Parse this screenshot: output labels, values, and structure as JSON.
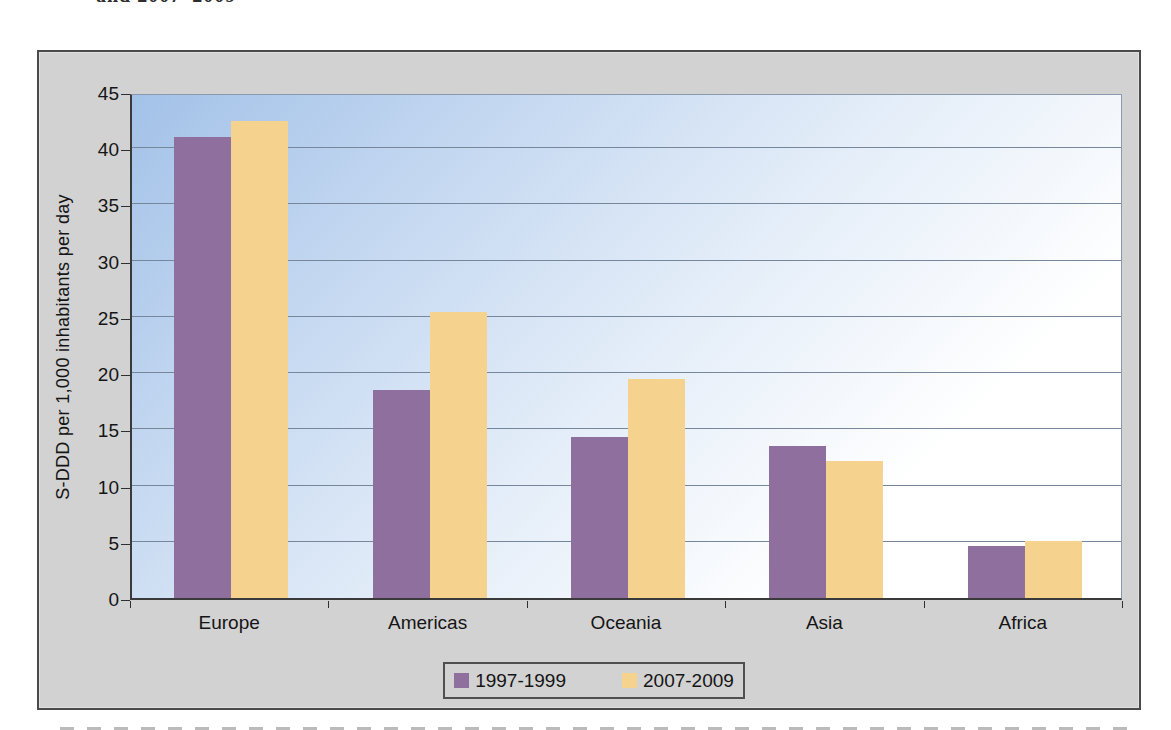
{
  "page": {
    "top_fragment": "and 2007–2009"
  },
  "chart_data": {
    "type": "bar",
    "title": "",
    "categories": [
      "Europe",
      "Americas",
      "Oceania",
      "Asia",
      "Africa"
    ],
    "series": [
      {
        "name": "1997-1999",
        "color": "#8f6f9e",
        "values": [
          41.0,
          18.5,
          14.3,
          13.5,
          4.6
        ]
      },
      {
        "name": "2007-2009",
        "color": "#f6d28f",
        "values": [
          42.4,
          25.4,
          19.5,
          12.2,
          5.1
        ]
      }
    ],
    "xlabel": "",
    "ylabel": "S-DDD per 1,000 inhabitants per day",
    "ylim": [
      0,
      45
    ],
    "yticks": [
      0,
      5,
      10,
      15,
      20,
      25,
      30,
      35,
      40,
      45
    ],
    "grid": true,
    "legend_position": "bottom-center",
    "colors": {
      "frame_background": "#d2d2d2",
      "frame_border": "#4a4a4a",
      "gridline": "#76879c",
      "plot_gradient_start": "#a3c2e8",
      "plot_gradient_end": "#ffffff",
      "axis_text": "#151515"
    }
  }
}
